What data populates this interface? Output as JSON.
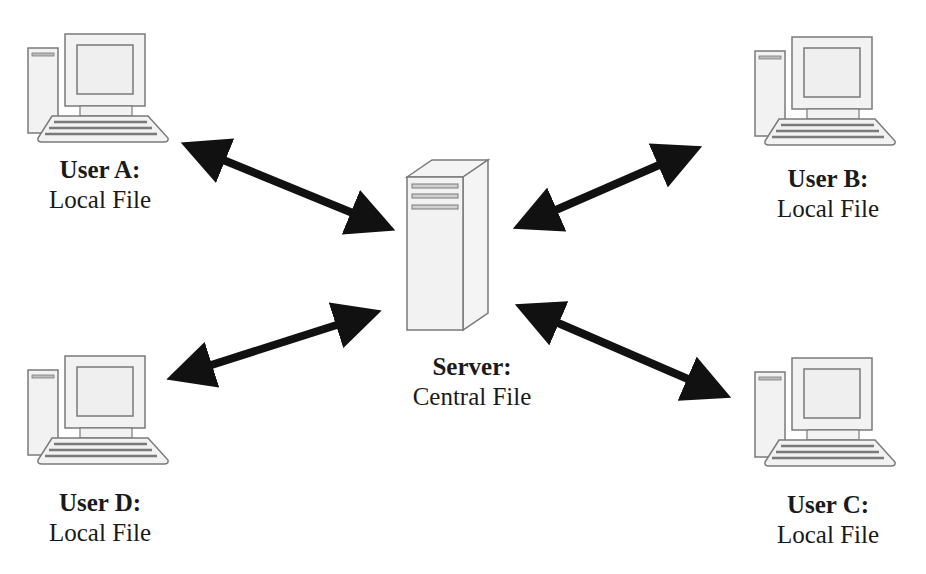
{
  "diagram": {
    "type": "client-server file sharing",
    "server": {
      "title": "Server:",
      "subtitle": "Central File",
      "icon": "server-tower-icon"
    },
    "users": [
      {
        "id": "A",
        "title": "User A:",
        "subtitle": "Local File",
        "icon": "desktop-computer-icon",
        "position": "top-left"
      },
      {
        "id": "B",
        "title": "User B:",
        "subtitle": "Local File",
        "icon": "desktop-computer-icon",
        "position": "top-right"
      },
      {
        "id": "C",
        "title": "User C:",
        "subtitle": "Local File",
        "icon": "desktop-computer-icon",
        "position": "bottom-right"
      },
      {
        "id": "D",
        "title": "User D:",
        "subtitle": "Local File",
        "icon": "desktop-computer-icon",
        "position": "bottom-left"
      }
    ],
    "connections": [
      {
        "from": "A",
        "to": "Server",
        "style": "double-arrow"
      },
      {
        "from": "B",
        "to": "Server",
        "style": "double-arrow"
      },
      {
        "from": "C",
        "to": "Server",
        "style": "double-arrow"
      },
      {
        "from": "D",
        "to": "Server",
        "style": "double-arrow"
      }
    ],
    "colors": {
      "arrow": "#111111",
      "icon_fill": "#f2f2f2",
      "icon_stroke": "#7a7a7a",
      "text": "#1a1a1a"
    }
  }
}
